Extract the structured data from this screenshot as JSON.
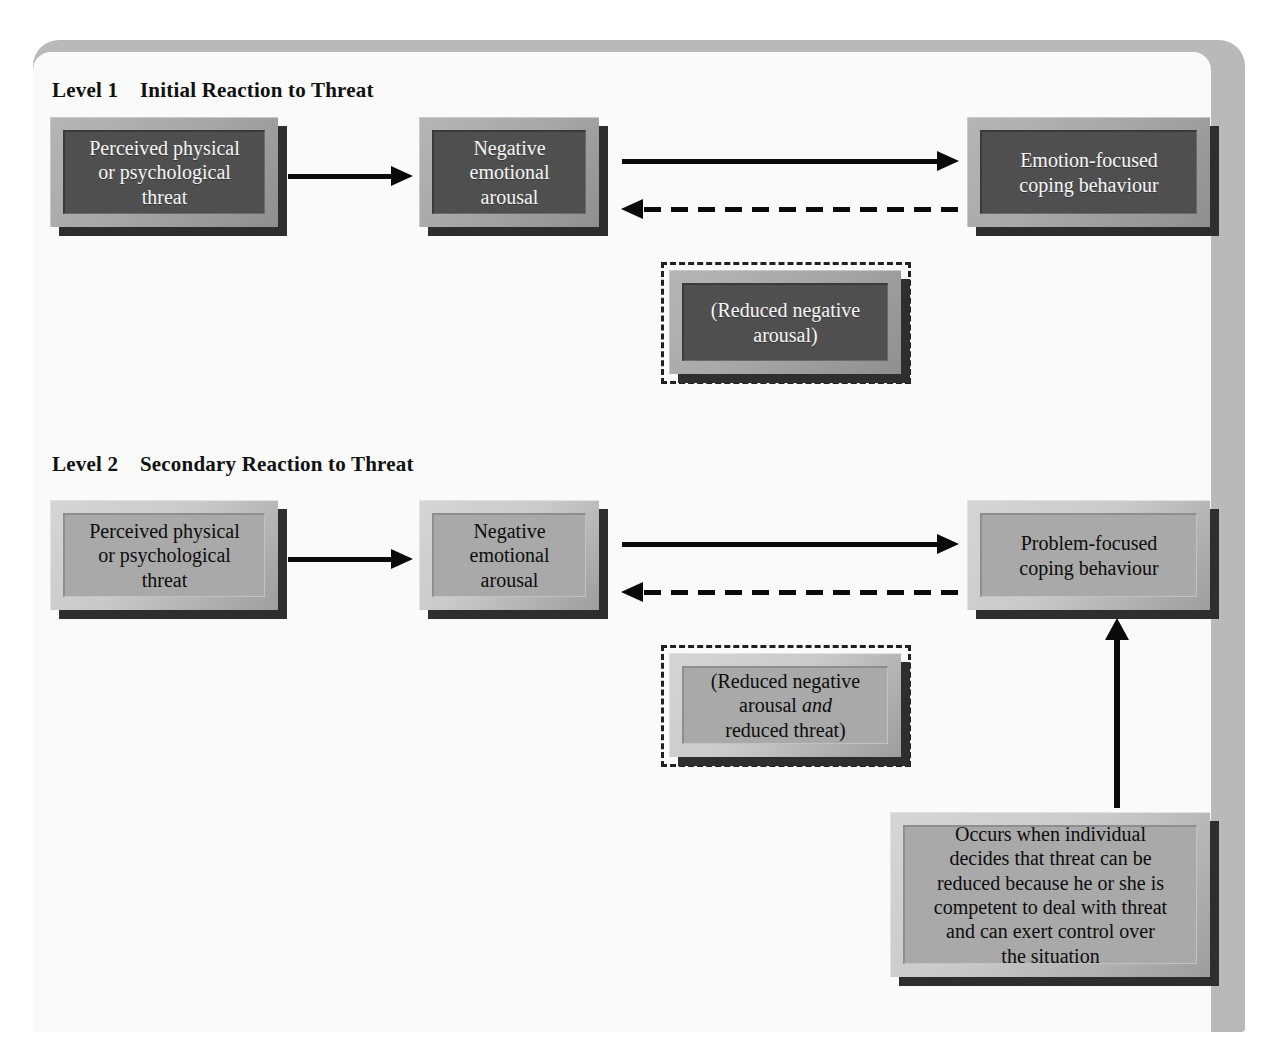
{
  "diagram": {
    "colors": {
      "page_background": "#fafafa",
      "frame_shadow": "#b9b9b9",
      "level1_box_fill": "#4f4f4f",
      "level1_box_bevel": "#a8a8a8",
      "level1_text": "#f6f6f6",
      "level2_box_fill": "#a9a9a9",
      "level2_box_bevel": "#cacaca",
      "level2_text": "#0d0d0d",
      "arrow": "#0a0a0a",
      "dashed_outline": "#202020"
    },
    "levels": [
      {
        "id": "level-1",
        "label": "Level 1",
        "name": "Initial Reaction to Threat",
        "heading": "Level 1    Initial Reaction to Threat",
        "style": "dark",
        "nodes": {
          "threat": "Perceived physical\nor psychological\nthreat",
          "arousal": "Negative\nemotional\narousal",
          "coping": "Emotion-focused\ncoping behaviour",
          "outcome": "(Reduced negative\narousal)"
        }
      },
      {
        "id": "level-2",
        "label": "Level 2",
        "name": "Secondary Reaction to Threat",
        "heading": "Level 2    Secondary Reaction to Threat",
        "style": "light",
        "nodes": {
          "threat": "Perceived physical\nor psychological\nthreat",
          "arousal": "Negative\nemotional\narousal",
          "coping": "Problem-focused\ncoping behaviour",
          "outcome_line1": "(Reduced negative",
          "outcome_line2a": "arousal ",
          "outcome_line2b": "and",
          "outcome_line3": "reduced threat)",
          "condition": "Occurs when individual\ndecides that threat can be\nreduced because he or she is\ncompetent to deal with threat\nand can exert control over\nthe situation"
        }
      }
    ],
    "connectors": [
      {
        "id": "l1-threat-to-arousal",
        "style": "solid",
        "direction": "right",
        "from": "threat",
        "to": "arousal"
      },
      {
        "id": "l1-arousal-to-coping",
        "style": "solid",
        "direction": "right",
        "from": "arousal",
        "to": "coping"
      },
      {
        "id": "l1-coping-to-arousal",
        "style": "dashed",
        "direction": "left",
        "from": "coping",
        "to": "arousal"
      },
      {
        "id": "l2-threat-to-arousal",
        "style": "solid",
        "direction": "right",
        "from": "threat",
        "to": "arousal"
      },
      {
        "id": "l2-arousal-to-coping",
        "style": "solid",
        "direction": "right",
        "from": "arousal",
        "to": "coping"
      },
      {
        "id": "l2-coping-to-arousal",
        "style": "dashed",
        "direction": "left",
        "from": "coping",
        "to": "arousal"
      },
      {
        "id": "l2-condition-to-coping",
        "style": "solid",
        "direction": "up",
        "from": "condition",
        "to": "coping"
      }
    ]
  }
}
